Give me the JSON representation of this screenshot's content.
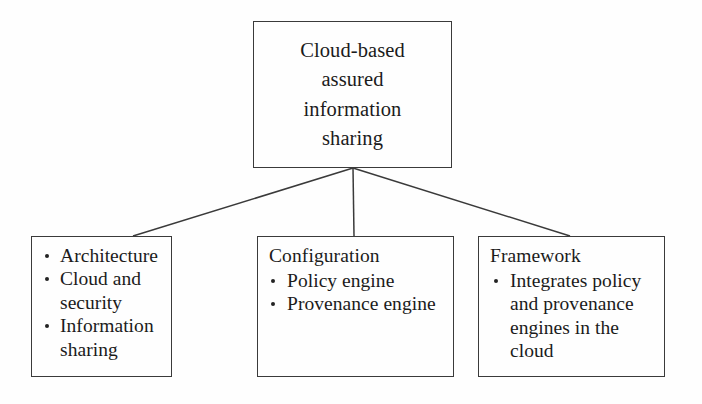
{
  "diagram": {
    "type": "hierarchy-tree",
    "root": {
      "id": "cloud-based-assured-information-sharing",
      "lines": [
        "Cloud-based",
        "assured",
        "information",
        "sharing"
      ],
      "text": "Cloud-based assured information sharing"
    },
    "children": [
      {
        "id": "architecture",
        "heading": "",
        "items": [
          "Architecture",
          "Cloud and security",
          "Information sharing"
        ]
      },
      {
        "id": "configuration",
        "heading": "Configuration",
        "items": [
          "Policy engine",
          "Provenance engine"
        ]
      },
      {
        "id": "framework",
        "heading": "Framework",
        "items": [
          "Integrates policy and provenance engines in the cloud"
        ]
      }
    ],
    "colors": {
      "stroke": "#3a3a3a",
      "text": "#1b1b1b",
      "background": "#fefefe",
      "bullet": "#232323"
    }
  }
}
